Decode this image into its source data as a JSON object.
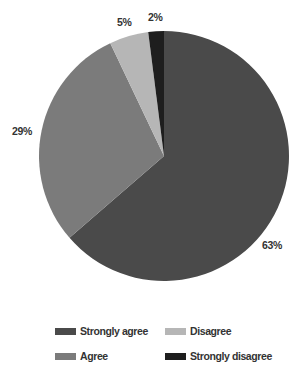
{
  "chart_data": {
    "type": "pie",
    "title": "",
    "title_clipped": true,
    "start_angle_deg": 0,
    "direction": "clockwise",
    "categories": [
      "Strongly agree",
      "Agree",
      "Disagree",
      "Strongly disagree"
    ],
    "values": [
      63,
      29,
      5,
      2
    ],
    "labels": [
      "63%",
      "29%",
      "5%",
      "2%"
    ],
    "colors": [
      "#4a4a4a",
      "#7b7b7b",
      "#b6b6b6",
      "#1e1e1e"
    ],
    "legend": {
      "position": "bottom",
      "columns": 2,
      "entries": [
        {
          "label": "Strongly agree",
          "color": "#4a4a4a"
        },
        {
          "label": "Disagree",
          "color": "#b6b6b6"
        },
        {
          "label": "Agree",
          "color": "#7b7b7b"
        },
        {
          "label": "Strongly disagree",
          "color": "#1e1e1e"
        }
      ]
    }
  },
  "layout": {
    "center": [
      164,
      156
    ],
    "radius": 125,
    "label_positions": [
      [
        262,
        249
      ],
      [
        12,
        135
      ],
      [
        117,
        26
      ],
      [
        148,
        21
      ]
    ]
  }
}
